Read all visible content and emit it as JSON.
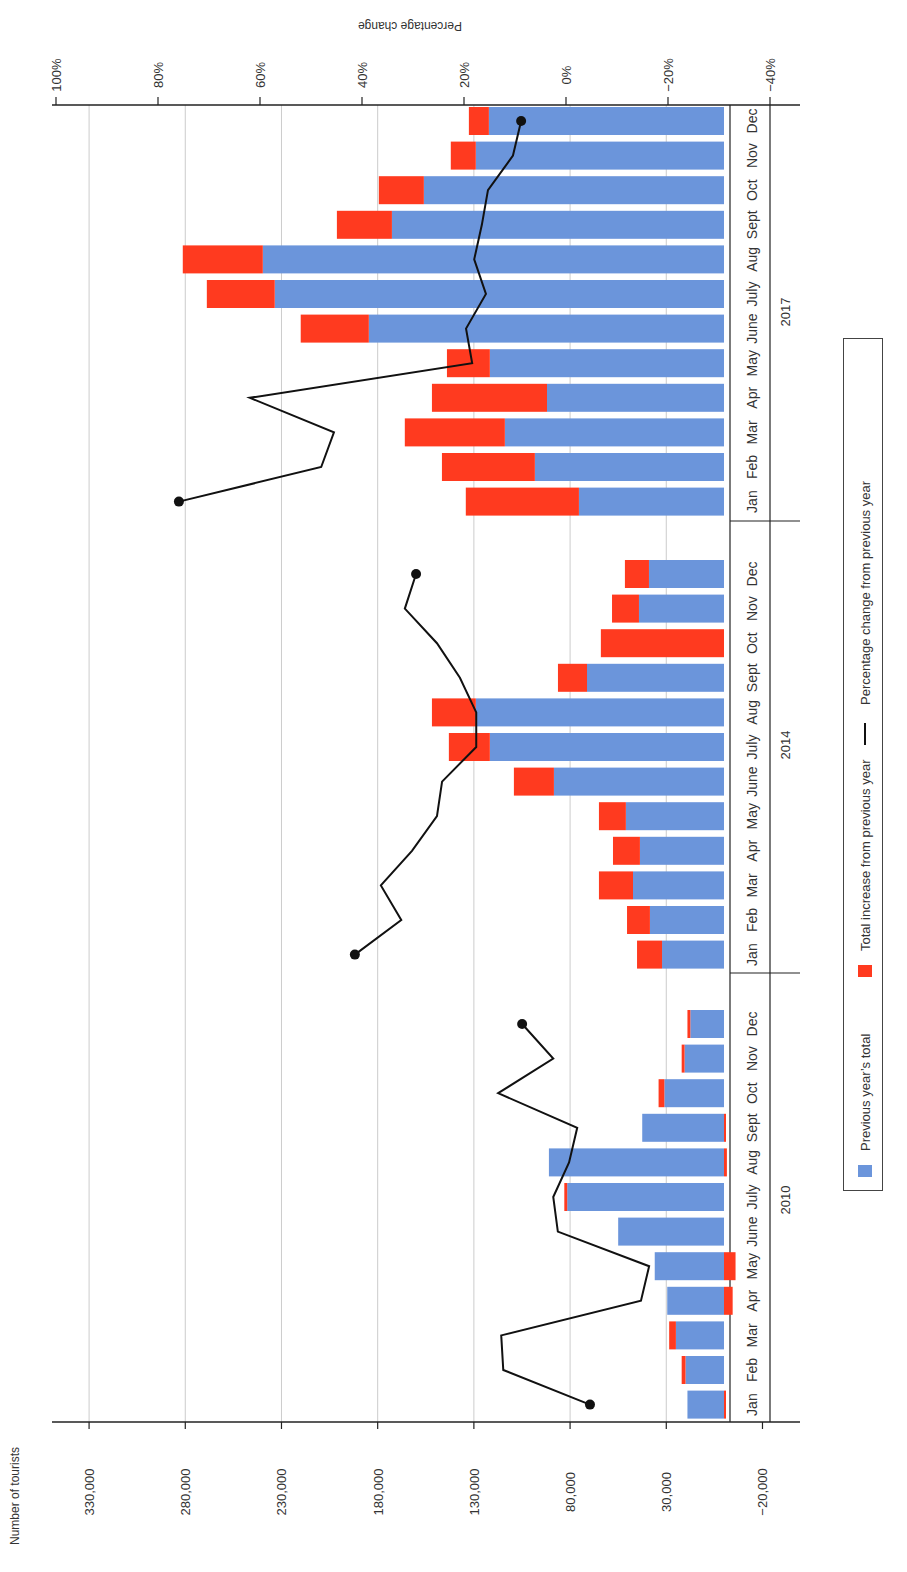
{
  "chart_data": {
    "type": "bar",
    "orientation": "rotated-90",
    "title": "",
    "xlabel": "",
    "ylabel": "Number of tourists",
    "y2label": "Percentage change",
    "ylim": [
      -20000,
      330000
    ],
    "y_ticks": [
      "330,000",
      "280,000",
      "230,000",
      "180,000",
      "130,000",
      "80,000",
      "30,000",
      "−20,000"
    ],
    "y_tick_values": [
      330000,
      280000,
      230000,
      180000,
      130000,
      80000,
      30000,
      -20000
    ],
    "y2lim": [
      -40,
      100
    ],
    "y2_ticks": [
      "100%",
      "80%",
      "60%",
      "40%",
      "20%",
      "0%",
      "−20%",
      "−40%"
    ],
    "y2_tick_values": [
      100,
      80,
      60,
      40,
      20,
      0,
      -20,
      -40
    ],
    "grid": true,
    "legend_position": "right",
    "legend": [
      {
        "label": "Previous year’s total",
        "color": "#6b95db",
        "kind": "bar"
      },
      {
        "label": "Total increase from previous year",
        "color": "#ff3a1f",
        "kind": "bar"
      },
      {
        "label": "Percentage change from previous year",
        "color": "#111111",
        "kind": "line"
      }
    ],
    "months": [
      "Jan",
      "Feb",
      "Mar",
      "Apr",
      "May",
      "June",
      "July",
      "Aug",
      "Sept",
      "Oct",
      "Nov",
      "Dec"
    ],
    "groups": [
      {
        "year": "2010",
        "previous_total": [
          19000,
          20000,
          25000,
          29500,
          36000,
          55000,
          81500,
          91000,
          42500,
          31000,
          20500,
          17500
        ],
        "current_total": [
          18500,
          22000,
          28500,
          25000,
          30000,
          55000,
          83000,
          89500,
          41500,
          34000,
          22000,
          19000
        ],
        "percent_change": [
          -4.7,
          12.3,
          12.7,
          -14.7,
          -16.3,
          1.6,
          2.5,
          -0.6,
          -2.2,
          13.3,
          2.5,
          8.6
        ]
      },
      {
        "year": "2014",
        "previous_total": [
          32200,
          38500,
          47300,
          43700,
          51000,
          88400,
          121700,
          129000,
          71200,
          0,
          44200,
          39000
        ],
        "current_total": [
          45200,
          50400,
          65000,
          57700,
          65000,
          109200,
          143000,
          151800,
          86300,
          64000,
          58200,
          51500
        ],
        "percent_change": [
          41.4,
          32.3,
          36.3,
          30.2,
          25.3,
          24.3,
          17.6,
          17.6,
          20.8,
          25.3,
          31.6,
          29.4
        ]
      },
      {
        "year": "2017",
        "previous_total": [
          75400,
          98300,
          113900,
          92000,
          121700,
          184600,
          233500,
          239700,
          172600,
          156000,
          129000,
          122200
        ],
        "current_total": [
          134200,
          146600,
          165900,
          151800,
          144000,
          220000,
          268800,
          281300,
          201200,
          179400,
          142000,
          132600
        ],
        "percent_change": [
          75.9,
          48.0,
          45.5,
          62.0,
          18.4,
          19.6,
          15.7,
          18.0,
          16.5,
          15.3,
          10.4,
          8.8
        ]
      }
    ]
  },
  "axis": {
    "left_title": "Number of tourists",
    "top_title": "Percentage change"
  },
  "legend": {
    "prev": "Previous year’s total",
    "increase": "Total increase from previous year",
    "pct": "Percentage change from previous year"
  },
  "colors": {
    "prev": "#6b95db",
    "increase": "#ff3a1f",
    "line": "#111111",
    "grid": "#cccccc",
    "axis": "#222222"
  }
}
